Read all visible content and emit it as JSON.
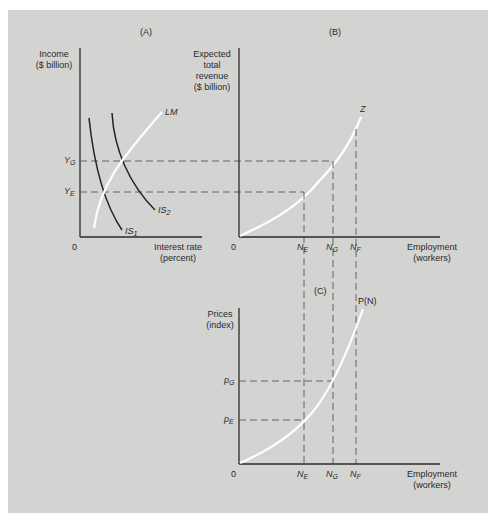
{
  "panels": {
    "A": {
      "title": "(A)",
      "y_axis_label": "Income\n($ billion)",
      "x_axis_label": "Interest rate\n(percent)",
      "origin": "0",
      "y_ticks": [
        {
          "main": "Y",
          "sub": "G"
        },
        {
          "main": "Y",
          "sub": "E"
        }
      ],
      "curves": [
        {
          "name": "LM",
          "label": "LM",
          "color": "#ffffff"
        },
        {
          "name": "IS1",
          "label_main": "IS",
          "label_sub": "1",
          "color": "#222222"
        },
        {
          "name": "IS2",
          "label_main": "IS",
          "label_sub": "2",
          "color": "#222222"
        }
      ]
    },
    "B": {
      "title": "(B)",
      "y_axis_label": "Expected\ntotal\nrevenue\n($ billion)",
      "x_axis_label": "Employment\n(workers)",
      "origin": "0",
      "x_ticks": [
        {
          "main": "N",
          "sub": "E"
        },
        {
          "main": "N",
          "sub": "G"
        },
        {
          "main": "N",
          "sub": "F"
        }
      ],
      "curve": {
        "name": "Z",
        "label": "Z",
        "color": "#ffffff"
      }
    },
    "C": {
      "title": "(C)",
      "y_axis_label": "Prices\n(index)",
      "x_axis_label": "Employment\n(workers)",
      "origin": "0",
      "y_ticks": [
        {
          "main": "p",
          "sub": "G"
        },
        {
          "main": "p",
          "sub": "E"
        }
      ],
      "x_ticks": [
        {
          "main": "N",
          "sub": "E"
        },
        {
          "main": "N",
          "sub": "G"
        },
        {
          "main": "N",
          "sub": "F"
        }
      ],
      "curve": {
        "name": "P(N)",
        "label": "P(N)",
        "color": "#ffffff"
      }
    }
  },
  "colors": {
    "background": "#d3d3d1",
    "axis": "#2a2a2a",
    "dashed": "#555555",
    "white_curve": "#ffffff"
  }
}
